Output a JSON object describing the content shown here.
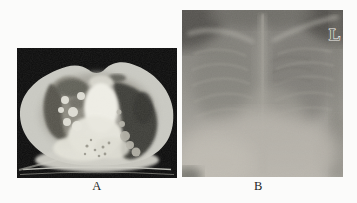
{
  "figure": {
    "background_color": "#fbfbfa",
    "label_color": "#1f1f1f",
    "panels": {
      "a": {
        "label": "A",
        "content": "axial-chest-ct-scan",
        "frame_color": "#0b0b0b"
      },
      "b": {
        "label": "B",
        "content": "frontal-chest-radiograph",
        "side_marker": "L",
        "marker_color": "#f2f1ec"
      }
    }
  }
}
